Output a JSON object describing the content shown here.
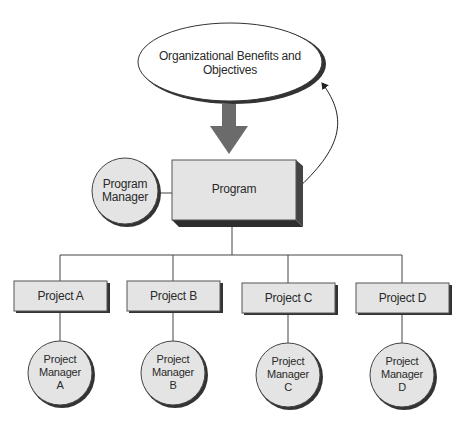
{
  "diagram": {
    "objectives": {
      "label": "Organizational Benefits and Objectives"
    },
    "program": {
      "label": "Program"
    },
    "program_manager": {
      "label_line1": "Program",
      "label_line2": "Manager"
    },
    "projects": [
      {
        "label": "Project A",
        "manager_line1": "Project",
        "manager_line2": "Manager",
        "manager_line3": "A"
      },
      {
        "label": "Project B",
        "manager_line1": "Project",
        "manager_line2": "Manager",
        "manager_line3": "B"
      },
      {
        "label": "Project C",
        "manager_line1": "Project",
        "manager_line2": "Manager",
        "manager_line3": "C"
      },
      {
        "label": "Project D",
        "manager_line1": "Project",
        "manager_line2": "Manager",
        "manager_line3": "D"
      }
    ],
    "colors": {
      "fill": "#e4e4e4",
      "shadow": "#333333",
      "arrow": "#6b6b6b",
      "line": "#444444"
    }
  }
}
